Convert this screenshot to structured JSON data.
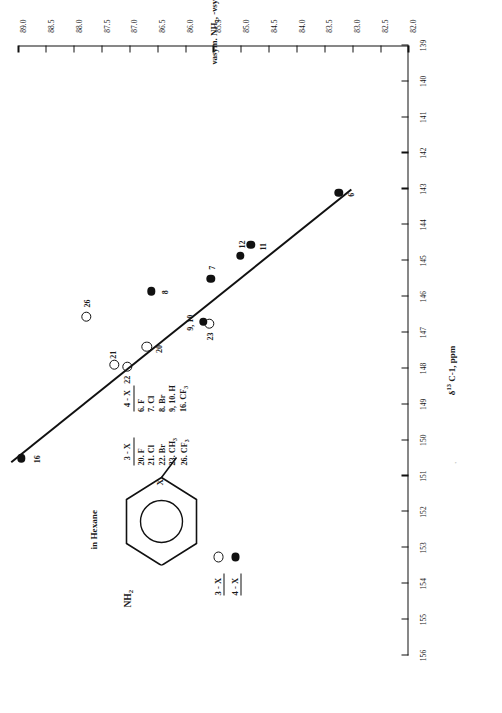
{
  "figure": {
    "solvent_note": "in Hexane",
    "structure": {
      "substituent_nh2": "NH2",
      "substituent_x": "X"
    },
    "speck": "'"
  },
  "axes": {
    "x": {
      "title_delta": "δ",
      "title_sup": "13",
      "title_rest": " C-1, ppm",
      "ticks": [
        156,
        155,
        154,
        153,
        152,
        151,
        150,
        149,
        148,
        147,
        146,
        145,
        144,
        143,
        142,
        141,
        140,
        139
      ],
      "min": 139,
      "max": 156
    },
    "y": {
      "title_p1": "νasym. NH",
      "title_sub1": "2",
      "title_p2": ", -νsym. NH",
      "title_sub2": "2",
      "title_p3": ", cm",
      "title_sup": "-1",
      "ticks": [
        82.0,
        82.5,
        83.0,
        83.5,
        84.0,
        84.5,
        85.0,
        85.5,
        86.0,
        86.5,
        87.0,
        87.5,
        88.0,
        88.5,
        89.0
      ],
      "tick_labels": [
        "82.0",
        "82.5",
        "83.0",
        "83.5",
        "84.0",
        "84.5",
        "85.0",
        "85.5",
        "86.0",
        "86.5",
        "87.0",
        "87.5",
        "88.0",
        "88.5",
        "89.0"
      ],
      "min": 82.0,
      "max": 89.0
    }
  },
  "legend_tables": [
    {
      "header": "3 - X",
      "items": [
        {
          "num": "20.",
          "grp": "F"
        },
        {
          "num": "21.",
          "grp": "Cl"
        },
        {
          "num": "22.",
          "grp": "Br"
        },
        {
          "num": "23.",
          "grp": "CH3"
        },
        {
          "num": "26.",
          "grp": "CF3"
        }
      ]
    },
    {
      "header": "4 - X",
      "items": [
        {
          "num": "6.",
          "grp": "F"
        },
        {
          "num": "7.",
          "grp": "Cl"
        },
        {
          "num": "8.",
          "grp": "Br"
        },
        {
          "num": "9, 10.",
          "grp": "H"
        },
        {
          "num": "16.",
          "grp": "CF3"
        }
      ]
    }
  ],
  "series_key": [
    {
      "label": "3 - X",
      "marker": "open-circle"
    },
    {
      "label": "4 - X",
      "marker": "filled-circle"
    }
  ],
  "chart_data": {
    "type": "scatter",
    "title": "",
    "xlabel": "δ13 C-1, ppm",
    "ylabel": "νasym. NH2, -νsym. NH2, cm-1",
    "xlim": [
      139,
      156
    ],
    "ylim": [
      82.0,
      89.0
    ],
    "grid": false,
    "legend_position": "inside-left",
    "series": [
      {
        "name": "3 - X",
        "marker": "open-circle",
        "points": [
          {
            "label": "20",
            "x": 147.4,
            "y": 86.7
          },
          {
            "label": "21",
            "x": 147.9,
            "y": 87.28
          },
          {
            "label": "22",
            "x": 147.95,
            "y": 87.05
          },
          {
            "label": "23",
            "x": 146.75,
            "y": 85.58
          },
          {
            "label": "26",
            "x": 146.55,
            "y": 87.78
          }
        ]
      },
      {
        "name": "4 - X",
        "marker": "filled-circle",
        "points": [
          {
            "label": "6",
            "x": 143.1,
            "y": 83.25
          },
          {
            "label": "7",
            "x": 145.5,
            "y": 85.55
          },
          {
            "label": "8",
            "x": 145.85,
            "y": 86.62
          },
          {
            "label": "9, 10",
            "x": 146.7,
            "y": 85.68
          },
          {
            "label": "11",
            "x": 144.55,
            "y": 84.83
          },
          {
            "label": "12",
            "x": 144.85,
            "y": 85.02
          },
          {
            "label": "16",
            "x": 150.5,
            "y": 88.95
          }
        ]
      }
    ],
    "fit_line": {
      "x1": 143.0,
      "y1": 83.05,
      "x2": 150.6,
      "y2": 89.15
    }
  }
}
